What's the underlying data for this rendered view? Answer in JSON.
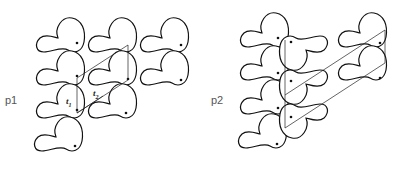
{
  "figure": {
    "panels": [
      {
        "id": "p1",
        "label": "p1",
        "description": "Wallpaper group p1: motifs related only by translations t1 and t2",
        "vectors": [
          {
            "name": "t1",
            "base": "t",
            "sub": "1"
          },
          {
            "name": "t2",
            "base": "t",
            "sub": "2"
          }
        ],
        "motif_count": 11
      },
      {
        "id": "p2",
        "label": "p2",
        "description": "Wallpaper group p2: motifs related by translations plus 2-fold rotations",
        "motif_count": 11
      }
    ]
  },
  "colors": {
    "stroke": "#111111",
    "background": "#ffffff",
    "label": "#555555"
  }
}
